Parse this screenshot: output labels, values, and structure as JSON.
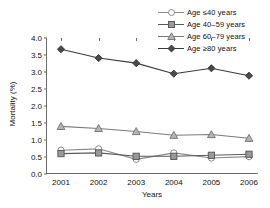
{
  "chart_data": {
    "type": "line",
    "title": "",
    "xlabel": "Years",
    "ylabel": "Mortality (%)",
    "categories": [
      "2001",
      "2002",
      "2003",
      "2004",
      "2005",
      "2006"
    ],
    "ylim": [
      0.0,
      4.0
    ],
    "yticks": [
      "0.0",
      "0.5",
      "1.0",
      "1.5",
      "2.0",
      "2.5",
      "3.0",
      "3.5",
      "4.0"
    ],
    "grid": false,
    "legend_position": "top-right",
    "series": [
      {
        "name": "Age ≤40 years",
        "marker": "circle",
        "color": "#8a8a8a",
        "values": [
          0.7,
          0.74,
          0.43,
          0.62,
          0.47,
          0.51
        ]
      },
      {
        "name": "Age 40–59 years",
        "marker": "square",
        "color": "#5a5a5a",
        "values": [
          0.6,
          0.62,
          0.52,
          0.52,
          0.55,
          0.58
        ]
      },
      {
        "name": "Age 60–79 years",
        "marker": "triangle",
        "color": "#7a7a7a",
        "values": [
          1.4,
          1.34,
          1.25,
          1.14,
          1.16,
          1.05
        ]
      },
      {
        "name": "Age ≥80 years",
        "marker": "diamond",
        "color": "#3a3a3a",
        "values": [
          3.67,
          3.41,
          3.26,
          2.95,
          3.11,
          2.89
        ]
      }
    ]
  },
  "legend": {
    "items": [
      {
        "label": "Age ≤40 years"
      },
      {
        "label": "Age 40–59 years"
      },
      {
        "label": "Age 60–79 years"
      },
      {
        "label": "Age ≥80 years"
      }
    ]
  },
  "axes": {
    "y_title": "Mortality (%)",
    "x_title": "Years"
  }
}
